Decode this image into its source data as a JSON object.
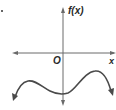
{
  "figure": {
    "type": "function-graph",
    "list_marker": ".",
    "axes": {
      "y_axis_label": "f(x)",
      "x_axis_label": "x",
      "origin_label": "O"
    },
    "curve": {
      "description": "Polynomial with negative leading coefficient and even end behavior: both ends fall; local max left of origin below x-axis, local min near y-axis below x-axis, local max right of origin above x-axis",
      "end_behavior": {
        "left": "down",
        "right": "down"
      },
      "features": [
        {
          "kind": "local-max",
          "position": "left of y-axis",
          "sign": "negative"
        },
        {
          "kind": "local-min",
          "position": "near y-axis",
          "sign": "negative"
        },
        {
          "kind": "local-max",
          "position": "right of y-axis",
          "sign": "positive"
        }
      ],
      "x_intercepts": 2
    },
    "colors": {
      "axis": "#555555",
      "curve": "#4a4a4a",
      "text": "#2a2a2a"
    }
  }
}
